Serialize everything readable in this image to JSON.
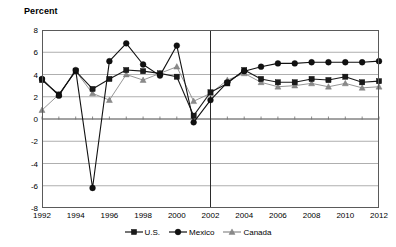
{
  "chart_data": {
    "type": "line",
    "title": "",
    "ylabel": "Percent",
    "xlabel": "",
    "ylim": [
      -8,
      8
    ],
    "ytick_step": 2,
    "yticks": [
      8,
      6,
      4,
      2,
      0,
      -2,
      -4,
      -6,
      -8
    ],
    "xlim": [
      1992,
      2012
    ],
    "xticks": [
      1992,
      1994,
      1996,
      1998,
      2000,
      2002,
      2004,
      2006,
      2008,
      2010,
      2012
    ],
    "x": [
      1992,
      1993,
      1994,
      1995,
      1996,
      1997,
      1998,
      1999,
      2000,
      2001,
      2002,
      2003,
      2004,
      2005,
      2006,
      2007,
      2008,
      2009,
      2010,
      2011,
      2012
    ],
    "grid": true,
    "legend_position": "bottom",
    "divider_year": 2002,
    "series": [
      {
        "name": "U.S.",
        "marker": "square",
        "color": "#1a1a1a",
        "values": [
          3.5,
          2.2,
          4.3,
          2.7,
          3.6,
          4.4,
          4.3,
          4.1,
          3.8,
          0.3,
          2.4,
          3.2,
          4.4,
          3.6,
          3.3,
          3.3,
          3.6,
          3.5,
          3.8,
          3.3,
          3.4
        ]
      },
      {
        "name": "Mexico",
        "marker": "circle",
        "color": "#111111",
        "values": [
          3.6,
          2.1,
          4.4,
          -6.2,
          5.2,
          6.8,
          4.9,
          3.9,
          6.6,
          -0.3,
          1.7,
          3.3,
          4.3,
          4.7,
          5.0,
          5.0,
          5.1,
          5.1,
          5.1,
          5.1,
          5.2
        ]
      },
      {
        "name": "Canada",
        "marker": "triangle",
        "color": "#8a8a8a",
        "values": [
          0.8,
          2.2,
          4.3,
          2.3,
          1.7,
          4.0,
          3.5,
          4.1,
          4.7,
          1.6,
          2.3,
          3.5,
          4.1,
          3.3,
          2.9,
          3.0,
          3.2,
          2.9,
          3.2,
          2.8,
          2.9
        ]
      }
    ]
  },
  "legend": {
    "items": [
      {
        "label": "U.S."
      },
      {
        "label": "Mexico"
      },
      {
        "label": "Canada"
      }
    ]
  }
}
